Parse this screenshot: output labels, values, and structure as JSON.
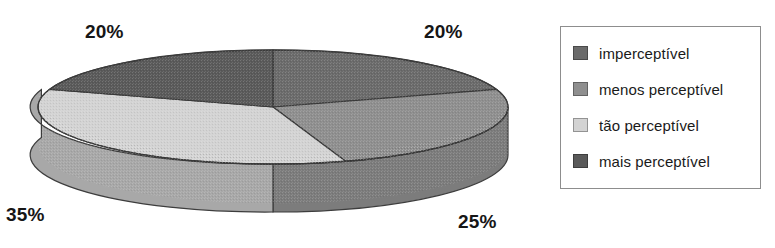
{
  "chart_data": {
    "type": "pie",
    "title": "",
    "three_d": true,
    "categories": [
      "imperceptível",
      "menos perceptível",
      "tão perceptível",
      "mais perceptível"
    ],
    "values": [
      20,
      25,
      35,
      20
    ],
    "data_labels": [
      "20%",
      "25%",
      "35%",
      "20%"
    ],
    "units": "percent",
    "legend_position": "right",
    "grid": false,
    "slice_colors": [
      "#6b6b6b",
      "#8f8f8f",
      "#d3d3d3",
      "#5a5a5a"
    ],
    "slice_side_colors": [
      "#5a5a5a",
      "#7c7c7c",
      "#a8a8a8",
      "#4a4a4a"
    ],
    "start_angle_deg": 0,
    "direction": "clockwise"
  },
  "labels": {
    "imperceptivel_value": "20%",
    "menos_value": "25%",
    "tao_value": "35%",
    "mais_value": "20%"
  },
  "legend": {
    "items": [
      {
        "label": "imperceptível",
        "color": "#6b6b6b",
        "swatch_name": "legend-swatch-imperceptivel"
      },
      {
        "label": "menos perceptível",
        "color": "#8f8f8f",
        "swatch_name": "legend-swatch-menos"
      },
      {
        "label": "tão perceptível",
        "color": "#d3d3d3",
        "swatch_name": "legend-swatch-tao"
      },
      {
        "label": "mais perceptível",
        "color": "#5a5a5a",
        "swatch_name": "legend-swatch-mais"
      }
    ],
    "border_color": "#8d8d8d"
  }
}
